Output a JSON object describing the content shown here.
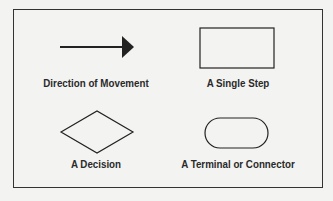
{
  "legend": {
    "items": [
      {
        "shape": "arrow",
        "label": "Direction of Movement"
      },
      {
        "shape": "rectangle",
        "label": "A Single Step"
      },
      {
        "shape": "diamond",
        "label": "A Decision"
      },
      {
        "shape": "rounded-rectangle",
        "label": "A Terminal or Connector"
      }
    ]
  },
  "colors": {
    "stroke": "#222222",
    "background": "#f3f3f1"
  }
}
